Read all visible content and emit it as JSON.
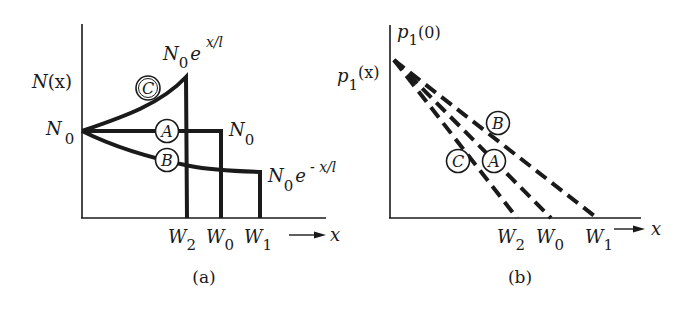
{
  "panel_a": {
    "caption": "(a)",
    "y_label": "N(x)",
    "y_label_main": "N",
    "y_label_arg": "(x)",
    "origin_label_main": "N",
    "origin_label_sub": "0",
    "x_arrow_label": "x",
    "curve_c_label_main": "N",
    "curve_c_label_sub": "0",
    "curve_c_label_e": "e",
    "curve_c_label_exp": "x/l",
    "curve_a_label_main": "N",
    "curve_a_label_sub": "0",
    "curve_b_label_main": "N",
    "curve_b_label_sub": "0",
    "curve_b_label_e": "e",
    "curve_b_label_exp": "- x/l",
    "ticks": [
      {
        "main": "W",
        "sub": "2"
      },
      {
        "main": "W",
        "sub": "0"
      },
      {
        "main": "W",
        "sub": "1"
      }
    ],
    "markers": {
      "A": "A",
      "B": "B",
      "C": "C"
    }
  },
  "panel_b": {
    "caption": "(b)",
    "y_top_label_main": "p",
    "y_top_label_sub": "1",
    "y_top_label_arg": "(0)",
    "y_label_main": "p",
    "y_label_sub": "1",
    "y_label_arg": "(x)",
    "x_arrow_label": "x",
    "ticks": [
      {
        "main": "W",
        "sub": "2"
      },
      {
        "main": "W",
        "sub": "0"
      },
      {
        "main": "W",
        "sub": "1"
      }
    ],
    "markers": {
      "A": "A",
      "B": "B",
      "C": "C"
    }
  },
  "colors": {
    "ink": "#1a1a1a",
    "background": "#ffffff"
  }
}
